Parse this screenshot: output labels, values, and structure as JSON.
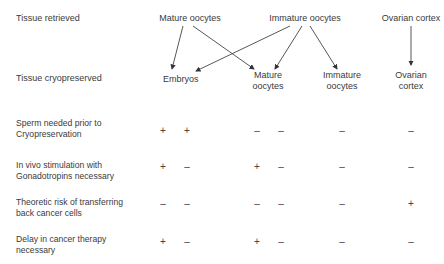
{
  "row_headers": {
    "retrieved": "Tissue retrieved",
    "cryopreserved": "Tissue cryopreserved"
  },
  "retrieved": [
    "Mature oocytes",
    "Immature oocytes",
    "Ovarian cortex"
  ],
  "cryopreserved": [
    {
      "line1": "Embryos",
      "line2": ""
    },
    {
      "line1": "Mature",
      "line2": "oocytes"
    },
    {
      "line1": "Immature",
      "line2": "oocytes"
    },
    {
      "line1": "Ovarian",
      "line2": "cortex"
    }
  ],
  "arrows": [
    {
      "from": "Mature oocytes",
      "to": "Embryos"
    },
    {
      "from": "Mature oocytes",
      "to": "Mature oocytes"
    },
    {
      "from": "Immature oocytes",
      "to": "Embryos"
    },
    {
      "from": "Immature oocytes",
      "to": "Mature oocytes"
    },
    {
      "from": "Immature oocytes",
      "to": "Immature oocytes"
    },
    {
      "from": "Ovarian cortex",
      "to": "Ovarian cortex"
    }
  ],
  "criteria": [
    {
      "line1": "Sperm needed prior to",
      "line2": "Cryopreservation",
      "marks": [
        "+",
        "+",
        "–",
        "–",
        "–",
        "–"
      ]
    },
    {
      "line1": "In vivo stimulation with",
      "line2": "Gonadotropins necessary",
      "marks": [
        "+",
        "–",
        "+",
        "–",
        "–",
        "–"
      ]
    },
    {
      "line1": "Theoretic risk of transferring",
      "line2": "back cancer cells",
      "marks": [
        "–",
        "–",
        "–",
        "–",
        "–",
        "+"
      ]
    },
    {
      "line1": "Delay in cancer therapy",
      "line2": "necessary",
      "marks": [
        "+",
        "–",
        "+",
        "–",
        "–",
        "–"
      ]
    }
  ]
}
